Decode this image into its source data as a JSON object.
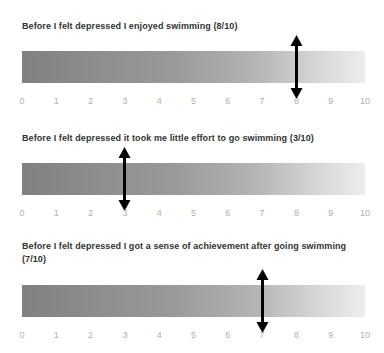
{
  "chart_data": {
    "type": "bar",
    "title": "",
    "xlabel": "",
    "ylabel": "",
    "xlim": [
      0,
      10
    ],
    "grid": false,
    "legend": null,
    "axis_ticks": [
      "0",
      "1",
      "2",
      "3",
      "4",
      "5",
      "6",
      "7",
      "8",
      "9",
      "10"
    ],
    "categories": [
      "Before I felt depressed I enjoyed swimming",
      "Before I felt depressed it took me little effort to go swimming",
      "Before I felt depressed I got a sense of achievement after going swimming"
    ],
    "values": [
      8,
      3,
      7
    ],
    "scale_max": 10,
    "marker_style": "double-headed-vertical-arrow",
    "bar_gradient": {
      "from": "#808080",
      "to": "#ededed",
      "direction": "left-to-right"
    }
  },
  "colors": {
    "title_text": "#333333",
    "tick_text": "#b0b0b0",
    "marker": "#000000",
    "background": "#ffffff"
  },
  "scales": [
    {
      "title": "Before I felt depressed I enjoyed swimming (8/10)",
      "value": 8,
      "value_label": "8/10",
      "ticks": [
        "0",
        "1",
        "2",
        "3",
        "4",
        "5",
        "6",
        "7",
        "8",
        "9",
        "10"
      ]
    },
    {
      "title": "Before I felt depressed it took me little effort to go swimming (3/10)",
      "value": 3,
      "value_label": "3/10",
      "ticks": [
        "0",
        "1",
        "2",
        "3",
        "4",
        "5",
        "6",
        "7",
        "8",
        "9",
        "10"
      ]
    },
    {
      "title": "Before I felt depressed I got a sense of achievement after going swimming (7/10)",
      "value": 7,
      "value_label": "7/10",
      "ticks": [
        "0",
        "1",
        "2",
        "3",
        "4",
        "5",
        "6",
        "7",
        "8",
        "9",
        "10"
      ]
    }
  ]
}
